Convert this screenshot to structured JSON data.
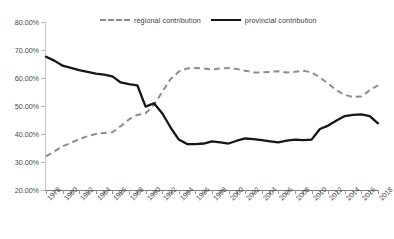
{
  "chart_data": {
    "type": "line",
    "title": "",
    "xlabel": "",
    "ylabel": "",
    "ylim": [
      20,
      80
    ],
    "ytick_labels": [
      "80.00%",
      "70.00%",
      "60.00%",
      "50.00%",
      "40.00%",
      "30.00%",
      "20.00%"
    ],
    "ytick_values": [
      80,
      70,
      60,
      50,
      40,
      30,
      20
    ],
    "xlim": [
      1978,
      2018
    ],
    "grid": false,
    "legend_position": "top-center",
    "x": [
      1978,
      1979,
      1980,
      1981,
      1982,
      1983,
      1984,
      1985,
      1986,
      1987,
      1988,
      1989,
      1990,
      1991,
      1992,
      1993,
      1994,
      1995,
      1996,
      1997,
      1998,
      1999,
      2000,
      2001,
      2002,
      2003,
      2004,
      2005,
      2006,
      2007,
      2008,
      2009,
      2010,
      2011,
      2012,
      2013,
      2014,
      2015,
      2016,
      2017,
      2018
    ],
    "xtick_labels": [
      "1978",
      "1980",
      "1982",
      "1984",
      "1986",
      "1988",
      "1990",
      "1992",
      "1994",
      "1996",
      "1998",
      "2000",
      "2002",
      "2004",
      "2006",
      "2008",
      "2010",
      "2012",
      "2014",
      "2016",
      "2018"
    ],
    "series": [
      {
        "name": "regional contribution",
        "style": "dashed",
        "color": "#8d8d8d",
        "values": [
          32.0,
          33.8,
          35.6,
          36.8,
          38.2,
          39.2,
          40.0,
          40.4,
          40.6,
          42.8,
          45.2,
          46.8,
          47.4,
          50.4,
          55.0,
          59.6,
          62.3,
          63.4,
          63.6,
          63.4,
          63.0,
          63.4,
          63.6,
          63.2,
          62.6,
          62.0,
          62.0,
          62.2,
          62.4,
          62.0,
          62.2,
          62.6,
          62.0,
          60.2,
          58.0,
          55.6,
          54.0,
          53.2,
          53.4,
          55.6,
          57.4
        ]
      },
      {
        "name": "provincial contribution",
        "style": "solid",
        "color": "#161616",
        "values": [
          67.6,
          66.2,
          64.4,
          63.6,
          62.8,
          62.2,
          61.6,
          61.2,
          60.6,
          58.4,
          57.8,
          57.4,
          49.8,
          51.0,
          47.4,
          42.4,
          38.0,
          36.4,
          36.4,
          36.6,
          37.4,
          37.0,
          36.6,
          37.6,
          38.4,
          38.2,
          37.8,
          37.4,
          37.0,
          37.6,
          38.0,
          37.8,
          38.0,
          41.8,
          43.0,
          44.8,
          46.4,
          46.8,
          47.0,
          46.4,
          43.8
        ]
      }
    ]
  },
  "legend": {
    "items": [
      {
        "label": "regional contribution"
      },
      {
        "label": "provincial contribution"
      }
    ]
  }
}
